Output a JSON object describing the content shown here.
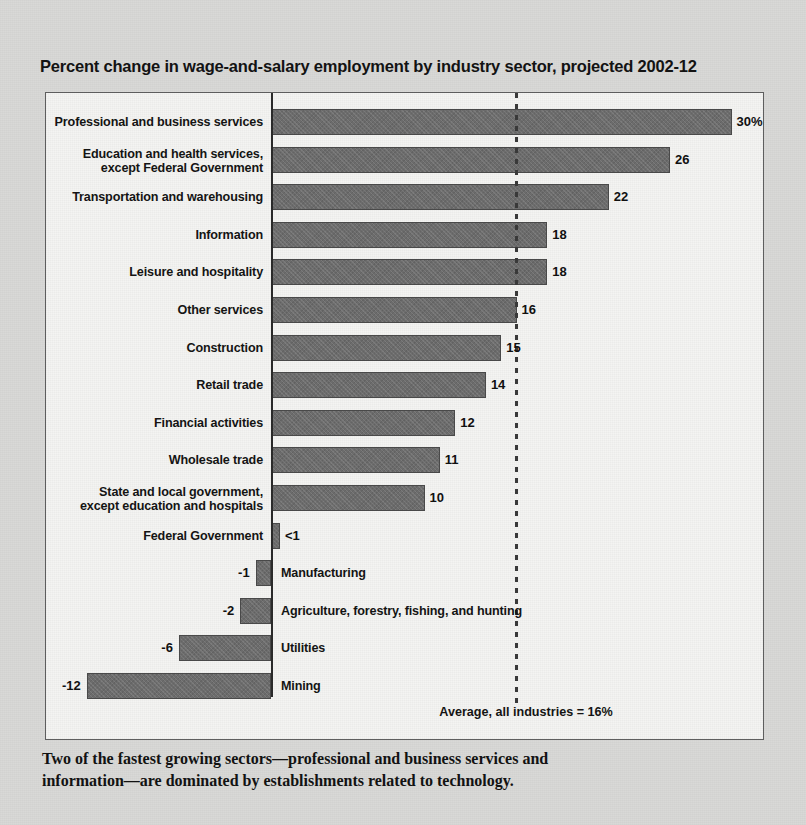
{
  "figure": {
    "title": "Percent change in wage-and-salary employment by industry sector, projected 2002-12",
    "footnote_line1": "Two of the fastest growing sectors—professional and business services and",
    "footnote_line2": "information—are dominated by establishments related to technology.",
    "average_label": "Average, all industries = 16%"
  },
  "colors": {
    "page_background": "#d9d9d7",
    "plot_background": "#f4f4f2",
    "bar_fill": "#6e6e6e",
    "bar_stroke": "#4a4a4a",
    "axis": "#2b2b2b",
    "text": "#141414"
  },
  "chart_data": {
    "type": "bar",
    "orientation": "horizontal",
    "title": "Percent change in wage-and-salary employment by industry sector, projected 2002-12",
    "xlabel": "",
    "ylabel": "",
    "xlim": [
      -13,
      31
    ],
    "grid": false,
    "legend": null,
    "annotations": [
      {
        "name": "average-line",
        "label": "Average, all industries = 16%",
        "value": 16,
        "style": "dashed-vertical"
      }
    ],
    "categories": [
      "Professional and business services",
      "Education and health services,\nexcept Federal Government",
      "Transportation and warehousing",
      "Information",
      "Leisure and hospitality",
      "Other services",
      "Construction",
      "Retail trade",
      "Financial activities",
      "Wholesale trade",
      "State and local government,\nexcept education and hospitals",
      "Federal Government",
      "Manufacturing",
      "Agriculture, forestry, fishing, and hunting",
      "Utilities",
      "Mining"
    ],
    "values": [
      30,
      26,
      22,
      18,
      18,
      16,
      15,
      14,
      12,
      11,
      10,
      0.5,
      -1,
      -2,
      -6,
      -12
    ],
    "value_labels": [
      "30%",
      "26",
      "22",
      "18",
      "18",
      "16",
      "15",
      "14",
      "12",
      "11",
      "10",
      "<1",
      "-1",
      "-2",
      "-6",
      "-12"
    ],
    "label_side": [
      "right",
      "right",
      "right",
      "right",
      "right",
      "right",
      "right",
      "right",
      "right",
      "right",
      "right",
      "right",
      "left",
      "left",
      "left",
      "left"
    ]
  }
}
